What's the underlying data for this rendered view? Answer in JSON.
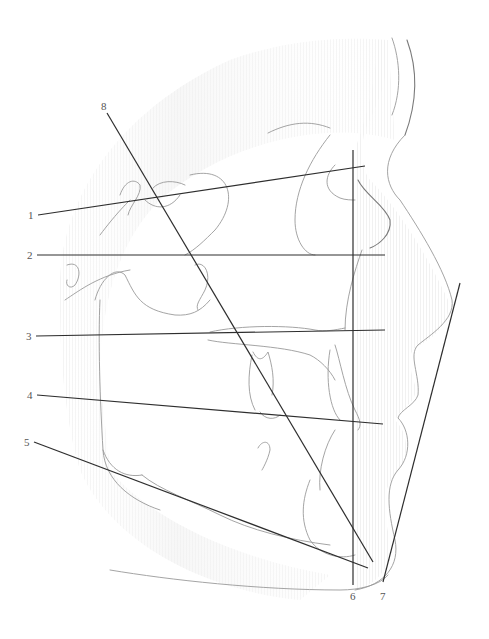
{
  "diagram": {
    "type": "cephalometric-tracing",
    "colors": {
      "reference_line": "#2e2e2e",
      "tracing": "#9a9a9a",
      "soft_tissue_shade": "#eeeeee",
      "label": "#555555",
      "background": "#ffffff"
    },
    "lines": [
      {
        "id": "1",
        "label": "1",
        "x1": 38,
        "y1": 215,
        "x2": 365,
        "y2": 166,
        "label_x": 28,
        "label_y": 219
      },
      {
        "id": "2",
        "label": "2",
        "x1": 37,
        "y1": 255,
        "x2": 385,
        "y2": 255,
        "label_x": 27,
        "label_y": 259
      },
      {
        "id": "3",
        "label": "3",
        "x1": 36,
        "y1": 336,
        "x2": 385,
        "y2": 330,
        "label_x": 26,
        "label_y": 340
      },
      {
        "id": "4",
        "label": "4",
        "x1": 37,
        "y1": 395,
        "x2": 383,
        "y2": 424,
        "label_x": 27,
        "label_y": 399
      },
      {
        "id": "5",
        "label": "5",
        "x1": 34,
        "y1": 442,
        "x2": 368,
        "y2": 568,
        "label_x": 24,
        "label_y": 446
      },
      {
        "id": "6",
        "label": "6",
        "x1": 353,
        "y1": 150,
        "x2": 353,
        "y2": 585,
        "label_x": 350,
        "label_y": 600
      },
      {
        "id": "7",
        "label": "7",
        "x1": 460,
        "y1": 283,
        "x2": 383,
        "y2": 582,
        "label_x": 380,
        "label_y": 600
      },
      {
        "id": "8",
        "label": "8",
        "x1": 107,
        "y1": 113,
        "x2": 373,
        "y2": 562,
        "label_x": 101,
        "label_y": 110
      }
    ]
  }
}
